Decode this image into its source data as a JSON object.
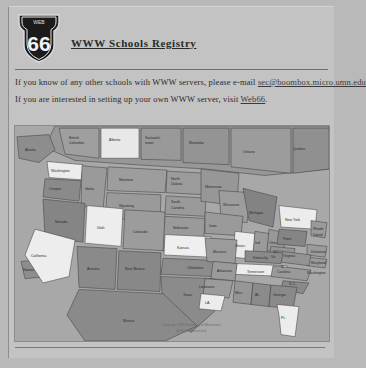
{
  "logo": {
    "name": "route-66-shield",
    "top_text": "WEB",
    "number": "66"
  },
  "header": {
    "title": "WWW Schools Registry"
  },
  "paragraphs": [
    {
      "before": "If you know of any other schools with WWW servers, please e-mail ",
      "link": "sec@boombox.micro.umn.edu",
      "after": ""
    },
    {
      "before": "If you are interested in setting up your own WWW server, visit ",
      "link": "Web66",
      "after": "."
    }
  ],
  "map": {
    "alt": "Clickable map of North America",
    "copyright_line1": "Copyright 1995 University of Minnesota",
    "copyright_line2": "All Rights Reserved",
    "colors": {
      "water": "#a8a8a8",
      "land_dark": "#8d8d8d",
      "land_mid": "#9a9a9a",
      "land_light": "#e8e8e8",
      "outline": "#3c3c3c"
    },
    "regions": [
      {
        "label": "Alaska",
        "x": 16,
        "y": 22,
        "shade": "dark"
      },
      {
        "label": "British\nColumbia",
        "x": 62,
        "y": 13,
        "shade": "mid"
      },
      {
        "label": "Alberta",
        "x": 100,
        "y": 14,
        "shade": "light"
      },
      {
        "label": "Saskatch-\newan",
        "x": 139,
        "y": 14,
        "shade": "mid"
      },
      {
        "label": "Manitoba",
        "x": 180,
        "y": 17,
        "shade": "mid"
      },
      {
        "label": "Ontario",
        "x": 236,
        "y": 25,
        "shade": "mid"
      },
      {
        "label": "Quebec",
        "x": 285,
        "y": 22,
        "shade": "mid"
      },
      {
        "label": "Washington",
        "x": 47,
        "y": 37,
        "shade": "light"
      },
      {
        "label": "Oregon",
        "x": 40,
        "y": 58,
        "shade": "dark"
      },
      {
        "label": "Idaho",
        "x": 75,
        "y": 66,
        "shade": "mid"
      },
      {
        "label": "Montana",
        "x": 115,
        "y": 46,
        "shade": "mid"
      },
      {
        "label": "Wyoming",
        "x": 116,
        "y": 76,
        "shade": "mid"
      },
      {
        "label": "North\nDakota",
        "x": 163,
        "y": 48,
        "shade": "mid"
      },
      {
        "label": "South\nDakota",
        "x": 163,
        "y": 70,
        "shade": "mid"
      },
      {
        "label": "Nebraska",
        "x": 166,
        "y": 92,
        "shade": "mid"
      },
      {
        "label": "Nevada",
        "x": 58,
        "y": 93,
        "shade": "dark"
      },
      {
        "label": "Utah",
        "x": 90,
        "y": 104,
        "shade": "light"
      },
      {
        "label": "Colorado",
        "x": 128,
        "y": 105,
        "shade": "mid"
      },
      {
        "label": "Kansas",
        "x": 172,
        "y": 110,
        "shade": "light"
      },
      {
        "label": "California",
        "x": 30,
        "y": 117,
        "shade": "light"
      },
      {
        "label": "Arizona",
        "x": 80,
        "y": 134,
        "shade": "dark"
      },
      {
        "label": "New Mexico",
        "x": 120,
        "y": 134,
        "shade": "dark"
      },
      {
        "label": "Oklahoma",
        "x": 181,
        "y": 131,
        "shade": "dark"
      },
      {
        "label": "Texas",
        "x": 176,
        "y": 155,
        "shade": "dark"
      },
      {
        "label": "Minnesota",
        "x": 196,
        "y": 56,
        "shade": "mid"
      },
      {
        "label": "Wisconsin",
        "x": 216,
        "y": 72,
        "shade": "mid"
      },
      {
        "label": "Iowa",
        "x": 212,
        "y": 93,
        "shade": "mid"
      },
      {
        "label": "Missouri",
        "x": 214,
        "y": 115,
        "shade": "mid"
      },
      {
        "label": "Illinois",
        "x": 228,
        "y": 110,
        "shade": "light"
      },
      {
        "label": "Ind",
        "x": 243,
        "y": 108,
        "shade": "mid"
      },
      {
        "label": "Ohio",
        "x": 257,
        "y": 107,
        "shade": "mid"
      },
      {
        "label": "Michigan",
        "x": 241,
        "y": 80,
        "shade": "dark"
      },
      {
        "label": "New York",
        "x": 279,
        "y": 86,
        "shade": "light"
      },
      {
        "label": "Penn",
        "x": 276,
        "y": 104,
        "shade": "dark"
      },
      {
        "label": "Rhode\nIsland",
        "x": 307,
        "y": 97,
        "shade": "mid"
      },
      {
        "label": "Delaware",
        "x": 305,
        "y": 116,
        "shade": "mid"
      },
      {
        "label": "Maryland",
        "x": 305,
        "y": 126,
        "shade": "mid"
      },
      {
        "label": "Washington",
        "x": 303,
        "y": 136,
        "shade": "mid"
      },
      {
        "label": "W. Vir.",
        "x": 266,
        "y": 118,
        "shade": "mid"
      },
      {
        "label": "Virginia",
        "x": 280,
        "y": 119,
        "shade": "mid"
      },
      {
        "label": "Kentucky",
        "x": 249,
        "y": 122,
        "shade": "dark"
      },
      {
        "label": "Tennessee",
        "x": 245,
        "y": 134,
        "shade": "light"
      },
      {
        "label": "N.\nCarolina",
        "x": 275,
        "y": 132,
        "shade": "mid"
      },
      {
        "label": "S.C.",
        "x": 281,
        "y": 145,
        "shade": "dark"
      },
      {
        "label": "Arkansas",
        "x": 212,
        "y": 133,
        "shade": "mid"
      },
      {
        "label": "Louisiana",
        "x": 205,
        "y": 148,
        "shade": "mid"
      },
      {
        "label": "Miss",
        "x": 228,
        "y": 153,
        "shade": "mid"
      },
      {
        "label": "AL.",
        "x": 246,
        "y": 155,
        "shade": "dark"
      },
      {
        "label": "Georgia",
        "x": 265,
        "y": 155,
        "shade": "dark"
      },
      {
        "label": "LA.",
        "x": 197,
        "y": 164,
        "shade": "light"
      },
      {
        "label": "FL.",
        "x": 272,
        "y": 177,
        "shade": "light"
      },
      {
        "label": "Mexico",
        "x": 118,
        "y": 180,
        "shade": "dark"
      },
      {
        "label": "Hawaii",
        "x": 18,
        "y": 133,
        "shade": "dark"
      }
    ]
  }
}
